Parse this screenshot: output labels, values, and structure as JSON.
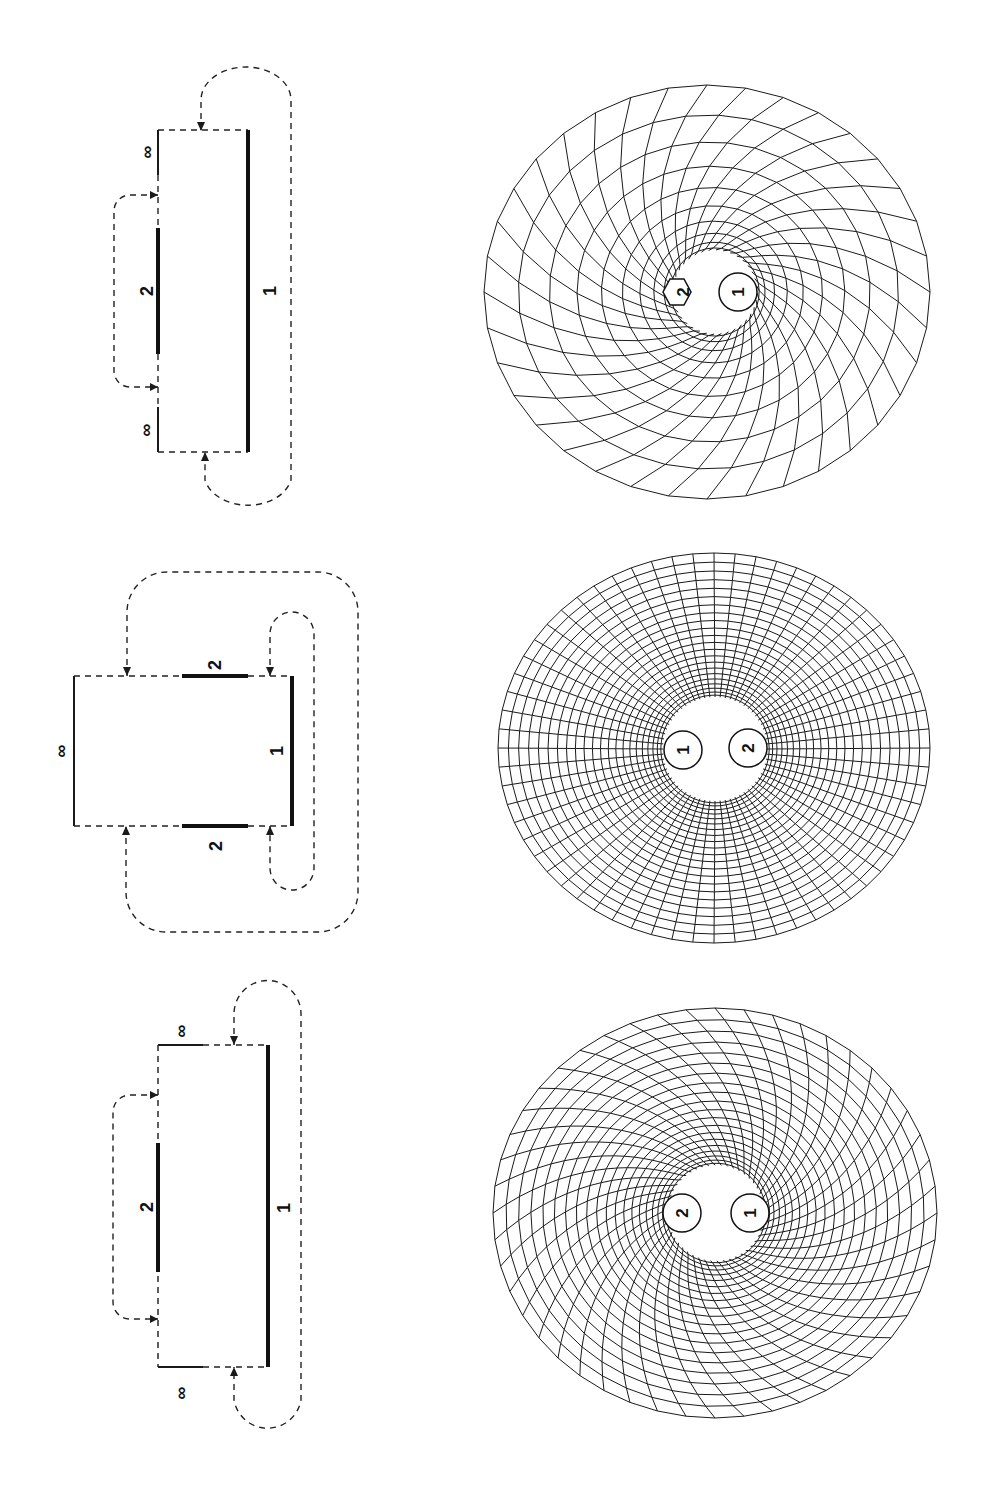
{
  "figure": {
    "orientation": "rotated-90",
    "panels": [
      {
        "id": "a",
        "diagram": {
          "labels": {
            "inner_boundary": "2",
            "outer_boundary": "1",
            "infinity_top": "∞",
            "infinity_bottom": "∞"
          }
        },
        "mesh": {
          "hole_labels": [
            "2",
            "1"
          ],
          "hole_2_shape": "hexagon",
          "style": "spiral-fan"
        }
      },
      {
        "id": "b",
        "diagram": {
          "labels": {
            "boundary_top": "2",
            "boundary_bottom": "2",
            "boundary_right": "1",
            "infinity_left": "∞"
          }
        },
        "mesh": {
          "hole_labels": [
            "1",
            "2"
          ],
          "style": "polar-grid"
        }
      },
      {
        "id": "c",
        "diagram": {
          "labels": {
            "inner_boundary": "2",
            "outer_boundary": "1",
            "infinity_top": "∞",
            "infinity_bottom": "∞"
          }
        },
        "mesh": {
          "hole_labels": [
            "2",
            "1"
          ],
          "style": "twisted-grid"
        }
      }
    ]
  }
}
